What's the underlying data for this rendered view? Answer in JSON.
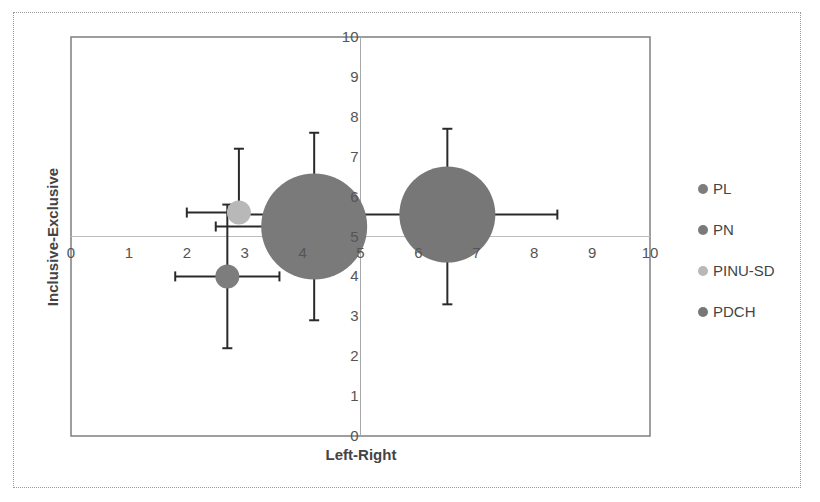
{
  "chart_data": {
    "type": "scatter",
    "subtype": "bubble",
    "title": "",
    "xlabel": "Left-Right",
    "ylabel": "Inclusive-Exclusive",
    "xlim": [
      0,
      10
    ],
    "ylim": [
      0,
      10
    ],
    "x_ticks": [
      "0",
      "1",
      "2",
      "3",
      "4",
      "5",
      "6",
      "7",
      "8",
      "9",
      "10"
    ],
    "y_ticks": [
      "0",
      "1",
      "2",
      "3",
      "4",
      "5",
      "6",
      "7",
      "8",
      "9",
      "10"
    ],
    "grid": false,
    "crosshair": {
      "x": 5,
      "y": 5
    },
    "legend_position": "right",
    "series": [
      {
        "name": "PL",
        "color": "#7d7d7d",
        "x": 2.7,
        "y": 4.0,
        "bubble_radius_px": 12,
        "x_err": [
          1.8,
          3.6
        ],
        "y_err": [
          2.2,
          5.8
        ]
      },
      {
        "name": "PN",
        "color": "#7a7a7a",
        "x": 4.2,
        "y": 5.25,
        "bubble_radius_px": 53,
        "x_err": [
          2.5,
          4.2
        ],
        "y_err": [
          2.9,
          7.6
        ]
      },
      {
        "name": "PINU-SD",
        "color": "#b8b8b8",
        "x": 2.9,
        "y": 5.6,
        "bubble_radius_px": 12,
        "x_err": [
          2.0,
          2.9
        ],
        "y_err": [
          5.6,
          7.2
        ]
      },
      {
        "name": "PDCH",
        "color": "#777777",
        "x": 6.5,
        "y": 5.55,
        "bubble_radius_px": 48,
        "x_err": [
          2.9,
          8.4
        ],
        "y_err": [
          3.3,
          7.7
        ]
      }
    ]
  },
  "legend": {
    "items": [
      {
        "label": "PL",
        "color": "#7d7d7d"
      },
      {
        "label": "PN",
        "color": "#7a7a7a"
      },
      {
        "label": "PINU-SD",
        "color": "#b8b8b8"
      },
      {
        "label": "PDCH",
        "color": "#777777"
      }
    ]
  }
}
